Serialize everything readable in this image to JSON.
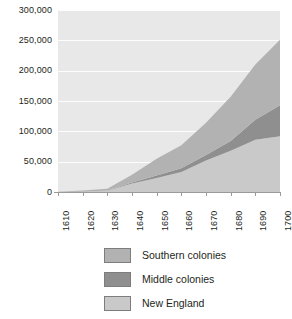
{
  "chart_data": {
    "type": "area",
    "stacked": true,
    "title": "",
    "xlabel": "",
    "ylabel": "",
    "categories": [
      1610,
      1620,
      1630,
      1640,
      1650,
      1660,
      1670,
      1680,
      1690,
      1700
    ],
    "x_tick_labels": [
      "1610",
      "1620",
      "1630",
      "1640",
      "1650",
      "1660",
      "1670",
      "1680",
      "1690",
      "1700"
    ],
    "y_tick_labels": [
      "0",
      "50,000",
      "100,000",
      "150,000",
      "200,000",
      "250,000",
      "300,000"
    ],
    "y_ticks": [
      0,
      50000,
      100000,
      150000,
      200000,
      250000,
      300000
    ],
    "ylim": [
      0,
      300000
    ],
    "xlim": [
      1610,
      1700
    ],
    "grid": true,
    "legend_position": "bottom",
    "stack_order_bottom_to_top": [
      "New England",
      "Middle colonies",
      "Southern colonies"
    ],
    "series": [
      {
        "name": "New England",
        "color": "#c9c9c9",
        "values": [
          0,
          500,
          2000,
          14000,
          23000,
          33000,
          52000,
          68000,
          86000,
          92000
        ]
      },
      {
        "name": "Middle colonies",
        "color": "#8f8f8f",
        "values": [
          0,
          0,
          500,
          1500,
          4000,
          6000,
          9000,
          16000,
          33000,
          51000
        ]
      },
      {
        "name": "Southern colonies",
        "color": "#b2b2b2",
        "values": [
          350,
          2000,
          3000,
          13000,
          28000,
          38000,
          53000,
          73000,
          91000,
          108000
        ]
      }
    ],
    "totals": [
      350,
      2500,
      5500,
      28500,
      55000,
      77000,
      114000,
      157000,
      210000,
      251000
    ]
  },
  "legend": {
    "items": [
      {
        "label": "Southern colonies",
        "color": "#b2b2b2"
      },
      {
        "label": "Middle colonies",
        "color": "#8f8f8f"
      },
      {
        "label": "New England",
        "color": "#c9c9c9"
      }
    ]
  },
  "colors": {
    "plot_background": "#e8e8e8",
    "gridline": "#fdfdfd",
    "axis": "#9a9a9a",
    "text": "#231f20",
    "page_background": "#ffffff"
  }
}
